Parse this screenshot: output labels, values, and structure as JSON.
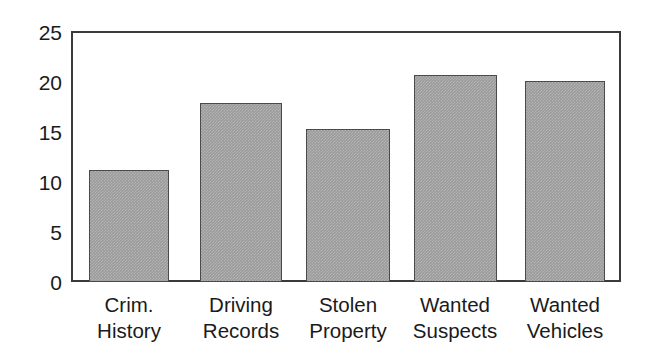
{
  "chart_data": {
    "type": "bar",
    "title": "",
    "subtitle": "",
    "xlabel": "",
    "ylabel": "",
    "categories": [
      "Crim. History",
      "Driving Records",
      "Stolen Property",
      "Wanted Suspects",
      "Wanted Vehicles"
    ],
    "category_lines": [
      [
        "Crim.",
        "History"
      ],
      [
        "Driving",
        "Records"
      ],
      [
        "Stolen",
        "Property"
      ],
      [
        "Wanted",
        "Suspects"
      ],
      [
        "Wanted",
        "Vehicles"
      ]
    ],
    "values": [
      11.2,
      17.8,
      15.2,
      20.6,
      20.0
    ],
    "ylim": [
      0,
      25
    ],
    "yticks": [
      0,
      5,
      10,
      15,
      20,
      25
    ],
    "ytick_labels": [
      "0",
      "5",
      "10",
      "15",
      "20",
      "25"
    ],
    "grid": false,
    "legend": null,
    "legend_position": "none",
    "bar_fill_color": "#9b9b9b",
    "bar_edge_color": "#4a4a4a",
    "axis_color": "#3a3a3a",
    "background_color": "#ffffff",
    "text_color": "#1a1a1a"
  },
  "axes": {
    "y_ticks": [
      {
        "label": "25",
        "value": 25
      },
      {
        "label": "20",
        "value": 20
      },
      {
        "label": "15",
        "value": 15
      },
      {
        "label": "10",
        "value": 10
      },
      {
        "label": "5",
        "value": 5
      },
      {
        "label": "0",
        "value": 0
      }
    ]
  }
}
